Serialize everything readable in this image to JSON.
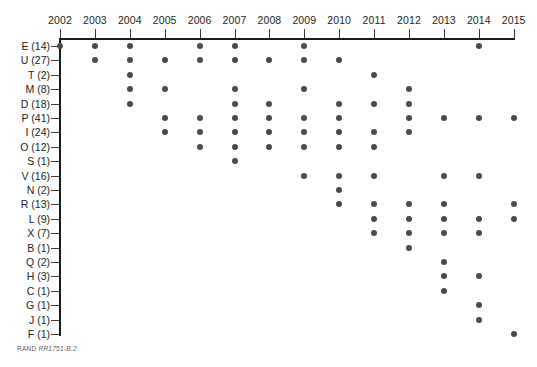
{
  "figure": {
    "source_note_prefix": "RAND",
    "source_note_id": "RR1751-B.2"
  },
  "chart_data": {
    "type": "scatter",
    "title": "",
    "subtitle": "",
    "xlabel": "",
    "ylabel": "",
    "grid": false,
    "legend": "none",
    "xlim": [
      2002,
      2015
    ],
    "x_tick_labels": [
      "2002",
      "2003",
      "2004",
      "2005",
      "2006",
      "2007",
      "2008",
      "2009",
      "2010",
      "2011",
      "2012",
      "2013",
      "2014",
      "2015"
    ],
    "x_values": [
      2002,
      2003,
      2004,
      2005,
      2006,
      2007,
      2008,
      2009,
      2010,
      2011,
      2012,
      2013,
      2014,
      2015
    ],
    "y_tick_labels": [
      "E (14)",
      "U (27)",
      "T (2)",
      "M (8)",
      "D (18)",
      "P (41)",
      "I (24)",
      "O (12)",
      "S (1)",
      "V (16)",
      "N (2)",
      "R (13)",
      "L (9)",
      "X (7)",
      "B (1)",
      "Q (2)",
      "H (3)",
      "C (1)",
      "G (1)",
      "J (1)",
      "F (1)"
    ],
    "categories": [
      "E (14)",
      "U (27)",
      "T (2)",
      "M (8)",
      "D (18)",
      "P (41)",
      "I (24)",
      "O (12)",
      "S (1)",
      "V (16)",
      "N (2)",
      "R (13)",
      "L (9)",
      "X (7)",
      "B (1)",
      "Q (2)",
      "H (3)",
      "C (1)",
      "G (1)",
      "J (1)",
      "F (1)"
    ],
    "series": [
      {
        "name": "E (14)",
        "count": 14,
        "years": [
          2002,
          2003,
          2004,
          2006,
          2007,
          2009,
          2014
        ]
      },
      {
        "name": "U (27)",
        "count": 27,
        "years": [
          2003,
          2004,
          2005,
          2006,
          2007,
          2008,
          2009,
          2010
        ]
      },
      {
        "name": "T (2)",
        "count": 2,
        "years": [
          2004,
          2011
        ]
      },
      {
        "name": "M (8)",
        "count": 8,
        "years": [
          2004,
          2005,
          2007,
          2009,
          2012
        ]
      },
      {
        "name": "D (18)",
        "count": 18,
        "years": [
          2004,
          2007,
          2008,
          2010,
          2011,
          2012
        ]
      },
      {
        "name": "P (41)",
        "count": 41,
        "years": [
          2005,
          2006,
          2007,
          2008,
          2009,
          2010,
          2012,
          2013,
          2014,
          2015
        ]
      },
      {
        "name": "I (24)",
        "count": 24,
        "years": [
          2005,
          2006,
          2007,
          2008,
          2009,
          2010,
          2011,
          2012
        ]
      },
      {
        "name": "O (12)",
        "count": 12,
        "years": [
          2006,
          2007,
          2008,
          2009,
          2010,
          2011
        ]
      },
      {
        "name": "S (1)",
        "count": 1,
        "years": [
          2007
        ]
      },
      {
        "name": "V (16)",
        "count": 16,
        "years": [
          2009,
          2010,
          2011,
          2013,
          2014
        ]
      },
      {
        "name": "N (2)",
        "count": 2,
        "years": [
          2010
        ]
      },
      {
        "name": "R (13)",
        "count": 13,
        "years": [
          2010,
          2011,
          2012,
          2013,
          2015
        ]
      },
      {
        "name": "L (9)",
        "count": 9,
        "years": [
          2011,
          2012,
          2013,
          2014,
          2015
        ]
      },
      {
        "name": "X (7)",
        "count": 7,
        "years": [
          2011,
          2012,
          2013,
          2014
        ]
      },
      {
        "name": "B (1)",
        "count": 1,
        "years": [
          2012
        ]
      },
      {
        "name": "Q (2)",
        "count": 2,
        "years": [
          2013
        ]
      },
      {
        "name": "H (3)",
        "count": 3,
        "years": [
          2013,
          2014
        ]
      },
      {
        "name": "C (1)",
        "count": 1,
        "years": [
          2013
        ]
      },
      {
        "name": "G (1)",
        "count": 1,
        "years": [
          2014
        ]
      },
      {
        "name": "J (1)",
        "count": 1,
        "years": [
          2014
        ]
      },
      {
        "name": "F (1)",
        "count": 1,
        "years": [
          2015
        ]
      }
    ],
    "marker": {
      "shape": "circle",
      "color": "#4a4a4f",
      "size_px": 6
    },
    "axis_color": "#1a1a1a"
  },
  "layout": {
    "x_origin_px": 60,
    "x_step_px": 34.9,
    "y_origin_px": 46,
    "y_step_px": 14.4
  }
}
